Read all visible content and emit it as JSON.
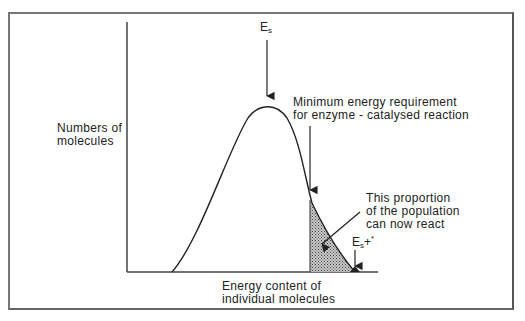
{
  "diagram": {
    "type": "energy-distribution-curve",
    "y_axis_label": [
      "Numbers of",
      "molecules"
    ],
    "x_axis_label": [
      "Energy content of",
      "individual molecules"
    ],
    "peak_label": {
      "main": "E",
      "sub": "s"
    },
    "threshold_label": [
      "Minimum energy requirement",
      "for enzyme - catalysed reaction"
    ],
    "shaded_region_label": [
      "This proportion",
      "of the population",
      "can now react"
    ],
    "tail_label": {
      "main": "E",
      "sub": "s",
      "suffix": "+",
      "sup": "*"
    },
    "colors": {
      "line": "#222222",
      "frame": "#777777",
      "shade": "#9a9a9a",
      "background": "#ffffff"
    }
  }
}
